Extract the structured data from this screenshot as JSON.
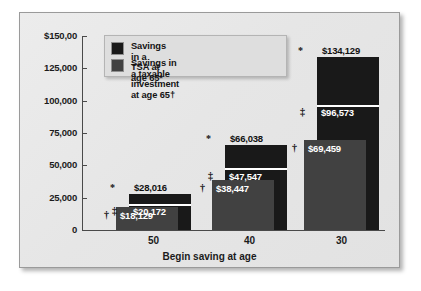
{
  "chart_data": {
    "type": "bar",
    "title": "",
    "xlabel": "Begin saving at age",
    "ylabel": "",
    "categories": [
      "50",
      "40",
      "30"
    ],
    "ylim": [
      0,
      150000
    ],
    "yticks": [
      0,
      25000,
      50000,
      75000,
      100000,
      125000,
      150000
    ],
    "ytick_labels": [
      "0",
      "25,000",
      "50,000",
      "75,000",
      "100,000",
      "125,000",
      "$150,00"
    ],
    "grid": false,
    "legend_position": "top-left",
    "series": [
      {
        "name": "Savings in a TSA at age 65*",
        "marker": "*",
        "color": "#191919",
        "values": [
          28016,
          66038,
          134129
        ],
        "value_labels": [
          "$28,016",
          "$66,038",
          "$134,129"
        ]
      },
      {
        "name": "Savings in a TSA at age 65 (after tax)",
        "marker": "‡",
        "color": "#191919",
        "values": [
          20172,
          47547,
          96573
        ],
        "value_labels": [
          "$20,172",
          "$47,547",
          "$96,573"
        ]
      },
      {
        "name": "Savings in a taxable investment at age 65†",
        "marker": "†",
        "color": "#414141",
        "values": [
          18129,
          38447,
          69459
        ],
        "value_labels": [
          "$18,129",
          "$38,447",
          "$69,459"
        ]
      }
    ]
  },
  "legend": {
    "items": [
      {
        "label": "Savings in a TSA at age 65*",
        "color": "#191919"
      },
      {
        "label": "Savings in a taxable\ninvestment at age 65†",
        "color": "#414141"
      }
    ]
  },
  "axis": {
    "x_title": "Begin saving at age",
    "x_labels": [
      "50",
      "40",
      "30"
    ],
    "y_labels": [
      "$150,00",
      "125,000",
      "100,000",
      "75,000",
      "50,000",
      "25,000",
      "0"
    ]
  },
  "markers": {
    "star": "*",
    "double_dagger": "‡",
    "dagger": "†"
  },
  "colors": {
    "bar_black": "#191919",
    "bar_gray": "#414141",
    "panel_bg": "#e9e9e9",
    "axis": "#4a4a4a"
  }
}
